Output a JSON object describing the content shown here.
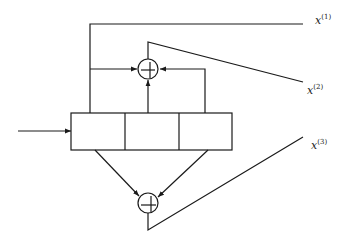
{
  "diagram": {
    "type": "convolutional-encoder",
    "stroke_color": "#1a1a1a",
    "background": "#ffffff",
    "shift_register": {
      "cells": 3
    },
    "adders": [
      {
        "id": "top-adder",
        "symbol": "+"
      },
      {
        "id": "bottom-adder",
        "symbol": "+"
      }
    ],
    "outputs": [
      {
        "base": "x",
        "superscript": "(1)"
      },
      {
        "base": "x",
        "superscript": "(2)"
      },
      {
        "base": "x",
        "superscript": "(3)"
      }
    ]
  }
}
